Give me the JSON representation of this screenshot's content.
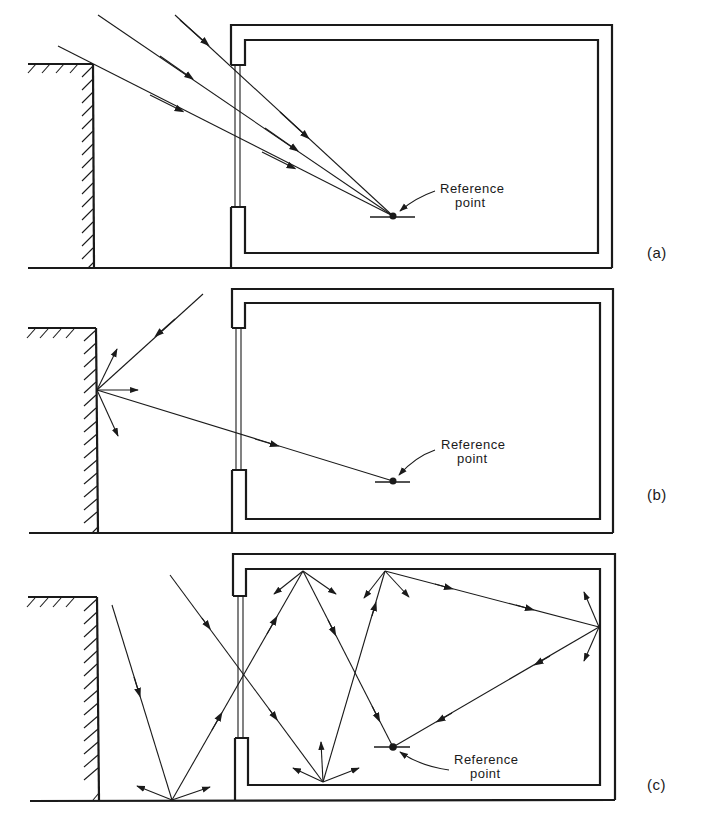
{
  "figure": {
    "panels": [
      {
        "id": "a",
        "label": "(a)",
        "reference_label_line1": "Reference",
        "reference_label_line2": "point",
        "component": "sky component"
      },
      {
        "id": "b",
        "label": "(b)",
        "reference_label_line1": "Reference",
        "reference_label_line2": "point",
        "component": "externally reflected component"
      },
      {
        "id": "c",
        "label": "(c)",
        "reference_label_line1": "Reference",
        "reference_label_line2": "point",
        "component": "internally reflected component"
      }
    ]
  },
  "colors": {
    "ink": "#1a1a1a",
    "background": "#ffffff"
  }
}
